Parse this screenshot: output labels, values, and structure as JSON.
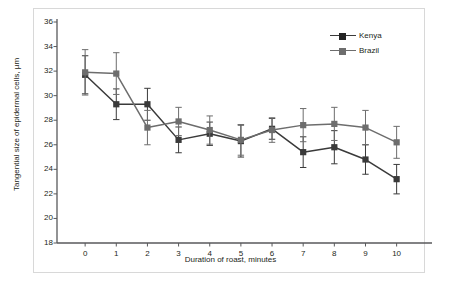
{
  "chart_data": {
    "type": "line",
    "title": "",
    "xlabel": "Duration of roast, minutes",
    "ylabel": "Tangential size of epidermal cells, µm",
    "x": [
      0,
      1,
      2,
      3,
      4,
      5,
      6,
      7,
      8,
      9,
      10
    ],
    "xlim": [
      -0.55,
      10.75
    ],
    "ylim": [
      18,
      36
    ],
    "xticks": [
      "0",
      "1",
      "2",
      "3",
      "4",
      "5",
      "6",
      "7",
      "8",
      "9",
      "10"
    ],
    "yticks": [
      "18",
      "20",
      "22",
      "24",
      "26",
      "28",
      "30",
      "32",
      "34",
      "36"
    ],
    "grid": false,
    "legend_position": "top-right",
    "series": [
      {
        "name": "Kenya",
        "color": "#3a3a3a",
        "marker": "square",
        "values": [
          31.7,
          29.3,
          29.3,
          26.4,
          26.9,
          26.3,
          27.3,
          25.4,
          25.8,
          24.8,
          23.2
        ],
        "errors": [
          1.55,
          1.25,
          1.3,
          1.05,
          0.95,
          1.3,
          0.85,
          1.25,
          1.35,
          1.2,
          1.2
        ]
      },
      {
        "name": "Brazil",
        "color": "#6d6d6d",
        "marker": "square",
        "values": [
          31.9,
          31.8,
          27.4,
          27.9,
          27.2,
          26.4,
          27.2,
          27.6,
          27.7,
          27.4,
          26.2
        ],
        "errors": [
          1.85,
          1.7,
          1.4,
          1.15,
          1.15,
          1.25,
          1.0,
          1.35,
          1.35,
          1.4,
          1.3
        ]
      }
    ]
  },
  "legend": {
    "items": [
      {
        "label": "Kenya"
      },
      {
        "label": "Brazil"
      }
    ]
  }
}
